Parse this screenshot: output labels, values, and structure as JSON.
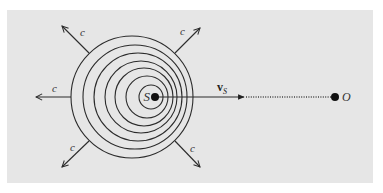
{
  "diagram": {
    "colors": {
      "panel": "#e6e6e6",
      "ink": "#2b2b2b",
      "background": "#ffffff"
    },
    "panel": {
      "x": 7,
      "y": 10,
      "w": 366,
      "h": 173
    },
    "source": {
      "label": "S",
      "x": 155,
      "y": 97
    },
    "observer": {
      "label": "O",
      "x": 335,
      "y": 97
    },
    "velocity": {
      "label": "v",
      "subscript": "S",
      "from_x": 155,
      "to_x": 244
    },
    "wave_speed_label": "c",
    "wavefronts": [
      {
        "cx": 132,
        "cy": 97,
        "r": 61
      },
      {
        "cx": 135,
        "cy": 97,
        "r": 52
      },
      {
        "cx": 138,
        "cy": 97,
        "r": 44
      },
      {
        "cx": 141,
        "cy": 97,
        "r": 36
      },
      {
        "cx": 144,
        "cy": 97,
        "r": 29
      },
      {
        "cx": 147,
        "cy": 97,
        "r": 21
      },
      {
        "cx": 151,
        "cy": 97,
        "r": 12
      }
    ],
    "rays": [
      {
        "name": "up-left",
        "x1": 89,
        "y1": 53,
        "x2": 62,
        "y2": 26,
        "lx": 80,
        "ly": 36
      },
      {
        "name": "up-right",
        "x1": 175,
        "y1": 53,
        "x2": 200,
        "y2": 28,
        "lx": 180,
        "ly": 35
      },
      {
        "name": "left",
        "x1": 71,
        "y1": 97,
        "x2": 36,
        "y2": 97,
        "lx": 52,
        "ly": 92
      },
      {
        "name": "down-left",
        "x1": 89,
        "y1": 141,
        "x2": 62,
        "y2": 167,
        "lx": 70,
        "ly": 151
      },
      {
        "name": "down-right",
        "x1": 175,
        "y1": 141,
        "x2": 200,
        "y2": 167,
        "lx": 190,
        "ly": 152
      }
    ]
  }
}
